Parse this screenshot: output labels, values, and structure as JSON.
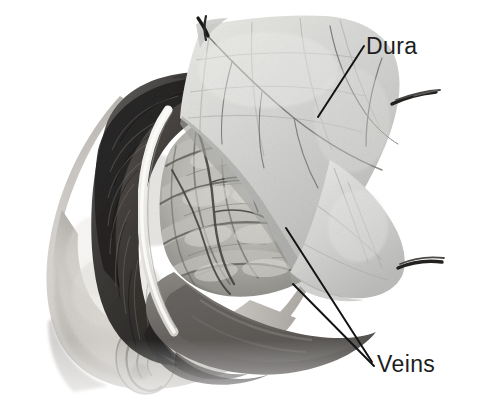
{
  "figure": {
    "kind": "surgical-photograph",
    "modality": "grayscale halftone photograph",
    "background_color": "#ffffff",
    "label_color": "#1d1d1d"
  },
  "labels": [
    {
      "id": "dura",
      "text": "Dura",
      "x": 366,
      "y": 35,
      "leader": {
        "from_x": 318,
        "from_y": 117,
        "to_x": 364,
        "to_y": 46
      }
    },
    {
      "id": "veins",
      "text": "Veins",
      "x": 377,
      "y": 353,
      "leaders": [
        {
          "from_x": 286,
          "from_y": 228,
          "to_x": 372,
          "to_y": 362
        },
        {
          "from_x": 293,
          "from_y": 284,
          "to_x": 374,
          "to_y": 366
        }
      ]
    }
  ],
  "anatomy": {
    "head": {
      "description": "infant head in lateral position, dark hair, ear and face profile at lower left"
    },
    "scalp_incision": {
      "description": "bright white scalp flap edge arcing along the craniotomy margin"
    },
    "dura_flap": {
      "description": "pale translucent dura mater reflected superiorly and laterally, held by stay sutures"
    },
    "brain": {
      "description": "exposed cerebral cortex showing gyri, sulci and surface vessels"
    },
    "sutures": [
      {
        "id": "suture-top-left",
        "x": 203,
        "y": 24
      },
      {
        "id": "suture-right-upper",
        "x": 430,
        "y": 92
      },
      {
        "id": "suture-right-lower",
        "x": 437,
        "y": 263
      }
    ]
  },
  "colors": {
    "paper": "#ffffff",
    "dura_light": "#d9dad8",
    "dura_mid": "#c2c4c1",
    "brain_light": "#cfcfc9",
    "brain_mid": "#a9a9a3",
    "brain_dark": "#6e6e69",
    "hair_dark": "#2e2c2b",
    "hair_mid": "#5b5856",
    "skin": "#c9c6c1",
    "incision_white": "#f4f3ef",
    "shadow": "#4a4846",
    "vessel": "#4d4b49"
  }
}
